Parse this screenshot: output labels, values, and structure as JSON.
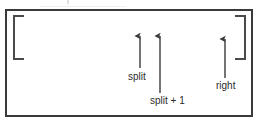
{
  "diagram": {
    "type": "annotated-array-range",
    "colors": {
      "frame_border": "#3a3a3a",
      "bracket": "#4a4a4a",
      "arrow": "#3a3a3a",
      "text": "#2b2b2b",
      "background": "#ffffff"
    },
    "array": {
      "open_bracket": "[",
      "close_bracket": "]"
    },
    "pointers": [
      {
        "id": "split",
        "label": "split",
        "arrow_x": 140,
        "tip_y": 30,
        "tail_y": 68,
        "label_x": 128,
        "label_y": 71
      },
      {
        "id": "split-plus-1",
        "label": "split + 1",
        "arrow_x": 160,
        "tip_y": 30,
        "tail_y": 93,
        "label_x": 150,
        "label_y": 95
      },
      {
        "id": "right",
        "label": "right",
        "arrow_x": 225,
        "tip_y": 33,
        "tail_y": 78,
        "label_x": 216,
        "label_y": 80
      }
    ]
  }
}
